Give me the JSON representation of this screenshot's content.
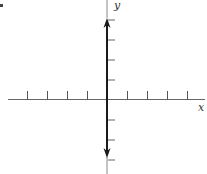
{
  "diagram": {
    "type": "coordinate-plane",
    "x_axis": {
      "label": "x",
      "ticks_left": 4,
      "ticks_right": 4,
      "tick_direction": "up"
    },
    "y_axis": {
      "label": "y",
      "ticks_above": 4,
      "ticks_below": 3,
      "tick_direction": "right",
      "arrows": [
        "up",
        "down"
      ]
    },
    "colors": {
      "axis": "#666666",
      "y_axis_thick": "#1a1a1a",
      "label": "#333333"
    }
  }
}
